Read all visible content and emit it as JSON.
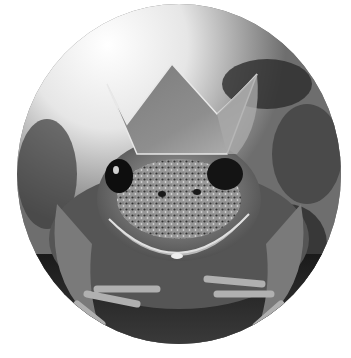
{
  "image": {
    "subject": "frog wearing a crown",
    "alt": "Black-and-white circular photo of a frog wearing a paper crown",
    "tone": "grayscale",
    "shape": "circle",
    "colors": {
      "background": "#ffffff",
      "highlight": "#f4f4f4",
      "midtone": "#8a8a8a",
      "shadow": "#141414"
    }
  }
}
